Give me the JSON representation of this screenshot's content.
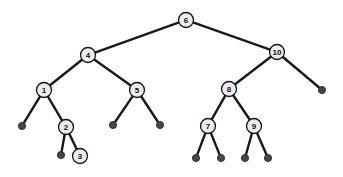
{
  "figure": {
    "background_color": "#ffffff",
    "width": 343,
    "height": 177
  },
  "style": {
    "edge_color": "#191919",
    "edge_width": 2.4,
    "internal_fill": "#ececec",
    "internal_stroke": "#151515",
    "internal_radius": 7.5,
    "leaf_fill": "#464646",
    "leaf_stroke": "#2b2b2b",
    "leaf_radius": 3.6,
    "label_color": "#101010",
    "label_size": 8
  },
  "chart_data": {
    "type": "diagram",
    "diagram_kind": "binary-search-tree",
    "node_count_internal": 10,
    "node_count_leaf": 12,
    "depth": 5,
    "root": "n6",
    "nodes": [
      {
        "id": "n6",
        "label": "6",
        "kind": "internal",
        "x": 186,
        "y": 20,
        "depth": 0
      },
      {
        "id": "n4",
        "label": "4",
        "kind": "internal",
        "x": 88,
        "y": 55,
        "depth": 1
      },
      {
        "id": "n10",
        "label": "10",
        "kind": "internal",
        "x": 277,
        "y": 52,
        "depth": 1
      },
      {
        "id": "n1",
        "label": "1",
        "kind": "internal",
        "x": 44,
        "y": 90,
        "depth": 2
      },
      {
        "id": "n5",
        "label": "5",
        "kind": "internal",
        "x": 137,
        "y": 90,
        "depth": 2
      },
      {
        "id": "n8",
        "label": "8",
        "kind": "internal",
        "x": 229,
        "y": 89,
        "depth": 2
      },
      {
        "id": "n2",
        "label": "2",
        "kind": "internal",
        "x": 66,
        "y": 127,
        "depth": 3
      },
      {
        "id": "n7",
        "label": "7",
        "kind": "internal",
        "x": 208,
        "y": 126,
        "depth": 3
      },
      {
        "id": "n9",
        "label": "9",
        "kind": "internal",
        "x": 254,
        "y": 126,
        "depth": 3
      },
      {
        "id": "n3",
        "label": "3",
        "kind": "internal",
        "x": 80,
        "y": 156,
        "depth": 4
      },
      {
        "id": "L1",
        "label": "",
        "kind": "leaf",
        "x": 22,
        "y": 126,
        "depth": 3,
        "parent": "n1"
      },
      {
        "id": "L2",
        "label": "",
        "kind": "leaf",
        "x": 113,
        "y": 125,
        "depth": 3,
        "parent": "n5"
      },
      {
        "id": "L3",
        "label": "",
        "kind": "leaf",
        "x": 160,
        "y": 125,
        "depth": 3,
        "parent": "n5"
      },
      {
        "id": "L4",
        "label": "",
        "kind": "leaf",
        "x": 322,
        "y": 90,
        "depth": 2,
        "parent": "n10"
      },
      {
        "id": "L5",
        "label": "",
        "kind": "leaf",
        "x": 61,
        "y": 155,
        "depth": 4,
        "parent": "n2"
      },
      {
        "id": "L6",
        "label": "",
        "kind": "leaf",
        "x": 196,
        "y": 158,
        "depth": 4,
        "parent": "n7"
      },
      {
        "id": "L7",
        "label": "",
        "kind": "leaf",
        "x": 221,
        "y": 158,
        "depth": 4,
        "parent": "n7"
      },
      {
        "id": "L8",
        "label": "",
        "kind": "leaf",
        "x": 245,
        "y": 158,
        "depth": 4,
        "parent": "n9"
      },
      {
        "id": "L9",
        "label": "",
        "kind": "leaf",
        "x": 268,
        "y": 158,
        "depth": 4,
        "parent": "n9"
      }
    ],
    "edges": [
      {
        "from": "n6",
        "to": "n4",
        "side": "left"
      },
      {
        "from": "n6",
        "to": "n10",
        "side": "right"
      },
      {
        "from": "n4",
        "to": "n1",
        "side": "left"
      },
      {
        "from": "n4",
        "to": "n5",
        "side": "right"
      },
      {
        "from": "n1",
        "to": "L1",
        "side": "left"
      },
      {
        "from": "n1",
        "to": "n2",
        "side": "right"
      },
      {
        "from": "n2",
        "to": "L5",
        "side": "left"
      },
      {
        "from": "n2",
        "to": "n3",
        "side": "right"
      },
      {
        "from": "n5",
        "to": "L2",
        "side": "left"
      },
      {
        "from": "n5",
        "to": "L3",
        "side": "right"
      },
      {
        "from": "n10",
        "to": "n8",
        "side": "left"
      },
      {
        "from": "n10",
        "to": "L4",
        "side": "right"
      },
      {
        "from": "n8",
        "to": "n7",
        "side": "left"
      },
      {
        "from": "n8",
        "to": "n9",
        "side": "right"
      },
      {
        "from": "n7",
        "to": "L6",
        "side": "left"
      },
      {
        "from": "n7",
        "to": "L7",
        "side": "right"
      },
      {
        "from": "n9",
        "to": "L8",
        "side": "left"
      },
      {
        "from": "n9",
        "to": "L9",
        "side": "right"
      }
    ],
    "labels_in_order": [
      "1",
      "2",
      "3",
      "4",
      "5",
      "6",
      "7",
      "8",
      "9",
      "10"
    ]
  }
}
